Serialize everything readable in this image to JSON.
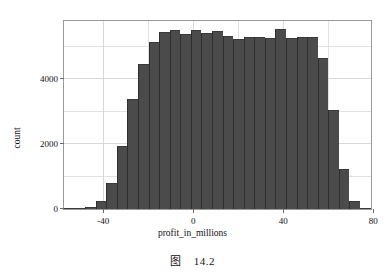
{
  "figure": {
    "caption_prefix": "图",
    "caption_number": "14.2"
  },
  "chart_data": {
    "type": "bar",
    "title": "",
    "subtitle": "",
    "xlabel": "profit_in_millions",
    "ylabel": "count",
    "grid": true,
    "legend": "none",
    "bar_color": "#4b4b4b",
    "bar_edge_color": "#2e2e2e",
    "plot_background": "#ffffff",
    "grid_color": "#e2e2e2",
    "xlim": [
      -57.5,
      79.0
    ],
    "ylim": [
      0,
      5800
    ],
    "xticks": [
      -40,
      0,
      40,
      80
    ],
    "xtick_labels": [
      "-40",
      "0",
      "40",
      "80"
    ],
    "yticks": [
      0,
      2000,
      4000
    ],
    "ytick_labels": [
      "0",
      "2000",
      "4000"
    ],
    "bin_width": 4.7,
    "x_left_edges": [
      -57.5,
      -52.8,
      -48.1,
      -43.4,
      -38.7,
      -34.0,
      -29.3,
      -24.6,
      -19.9,
      -15.2,
      -10.5,
      -5.8,
      -1.1,
      3.6,
      8.3,
      13.0,
      17.7,
      22.4,
      27.1,
      31.8,
      36.5,
      41.2,
      45.9,
      50.6,
      55.3,
      60.0,
      64.7,
      69.4,
      74.1
    ],
    "categories": [
      "-57.5",
      "-52.8",
      "-48.1",
      "-43.4",
      "-38.7",
      "-34.0",
      "-29.3",
      "-24.6",
      "-19.9",
      "-15.2",
      "-10.5",
      "-5.8",
      "-1.1",
      "3.6",
      "8.3",
      "13.0",
      "17.7",
      "22.4",
      "27.1",
      "31.8",
      "36.5",
      "41.2",
      "45.9",
      "50.6",
      "55.3",
      "60.0",
      "64.7",
      "69.4",
      "74.1"
    ],
    "values": [
      20,
      40,
      60,
      250,
      800,
      1950,
      3400,
      4480,
      5150,
      5450,
      5520,
      5400,
      5530,
      5440,
      5480,
      5350,
      5230,
      5320,
      5310,
      5290,
      5540,
      5280,
      5310,
      5300,
      4660,
      3060,
      1230,
      260,
      40
    ]
  }
}
